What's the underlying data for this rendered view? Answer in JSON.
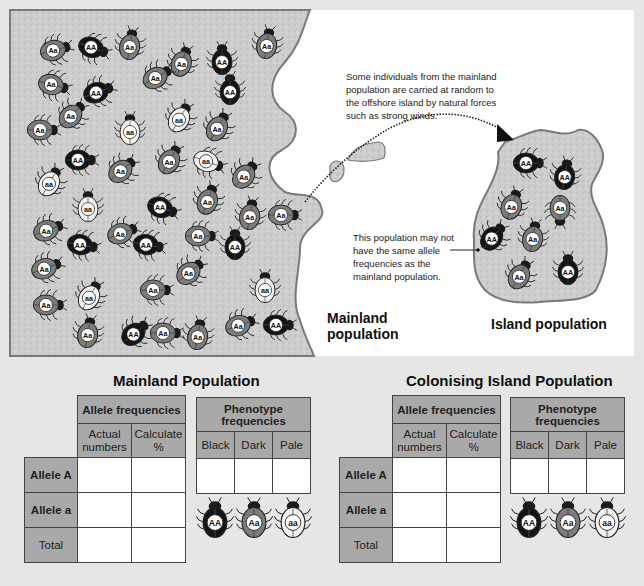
{
  "diagram": {
    "callout_top": "Some individuals from the mainland population are carried at random to the offshore island by natural forces such as strong winds.",
    "callout_top_lines": [
      "Some individuals from the mainland",
      "population are carried at random to",
      "the offshore island by natural forces",
      "such as strong winds."
    ],
    "callout_island_lines": [
      "This population may not",
      "have the same allele",
      "frequencies as the",
      "mainland population."
    ],
    "mainland_label_lines": [
      "Mainland",
      "population"
    ],
    "island_label": "Island population",
    "colors": {
      "background": "#e6e6e6",
      "land": "#c9c9c9",
      "coast": "#7a7a7a",
      "black_beetle": "#141414",
      "dark_beetle": "#7c7c7c",
      "pale_beetle": "#f2f2f2",
      "table_header": "#a9a9a9"
    },
    "mainland_beetles": [
      {
        "x": 55,
        "y": 50,
        "g": "Aa",
        "r": -15
      },
      {
        "x": 93,
        "y": 48,
        "g": "AA",
        "r": 20
      },
      {
        "x": 130,
        "y": 45,
        "g": "Aa",
        "r": -80
      },
      {
        "x": 182,
        "y": 62,
        "g": "Aa",
        "r": -70
      },
      {
        "x": 222,
        "y": 60,
        "g": "AA",
        "r": -90
      },
      {
        "x": 267,
        "y": 44,
        "g": "Aa",
        "r": -80
      },
      {
        "x": 53,
        "y": 85,
        "g": "Aa",
        "r": 15
      },
      {
        "x": 98,
        "y": 92,
        "g": "AA",
        "r": -20
      },
      {
        "x": 157,
        "y": 77,
        "g": "Aa",
        "r": -30
      },
      {
        "x": 230,
        "y": 90,
        "g": "AA",
        "r": -90
      },
      {
        "x": 72,
        "y": 115,
        "g": "Aa",
        "r": -45
      },
      {
        "x": 130,
        "y": 130,
        "g": "aa",
        "r": -90
      },
      {
        "x": 180,
        "y": 118,
        "g": "aa",
        "r": -60
      },
      {
        "x": 218,
        "y": 127,
        "g": "Aa",
        "r": -60
      },
      {
        "x": 42,
        "y": 130,
        "g": "Aa",
        "r": 0
      },
      {
        "x": 80,
        "y": 160,
        "g": "AA",
        "r": 0
      },
      {
        "x": 122,
        "y": 170,
        "g": "Aa",
        "r": -40
      },
      {
        "x": 170,
        "y": 160,
        "g": "Aa",
        "r": -60
      },
      {
        "x": 208,
        "y": 162,
        "g": "aa",
        "r": 20
      },
      {
        "x": 245,
        "y": 175,
        "g": "Aa",
        "r": -50
      },
      {
        "x": 50,
        "y": 182,
        "g": "aa",
        "r": -60
      },
      {
        "x": 88,
        "y": 207,
        "g": "aa",
        "r": -90
      },
      {
        "x": 162,
        "y": 208,
        "g": "AA",
        "r": 20
      },
      {
        "x": 208,
        "y": 200,
        "g": "Aa",
        "r": -70
      },
      {
        "x": 250,
        "y": 215,
        "g": "Aa",
        "r": -80
      },
      {
        "x": 283,
        "y": 215,
        "g": "Aa",
        "r": 0
      },
      {
        "x": 48,
        "y": 230,
        "g": "Aa",
        "r": -20
      },
      {
        "x": 82,
        "y": 245,
        "g": "AA",
        "r": 10
      },
      {
        "x": 122,
        "y": 233,
        "g": "Aa",
        "r": -20
      },
      {
        "x": 148,
        "y": 245,
        "g": "AA",
        "r": 10
      },
      {
        "x": 200,
        "y": 236,
        "g": "Aa",
        "r": 0
      },
      {
        "x": 235,
        "y": 245,
        "g": "AA",
        "r": -90
      },
      {
        "x": 46,
        "y": 268,
        "g": "Aa",
        "r": -20
      },
      {
        "x": 190,
        "y": 272,
        "g": "Aa",
        "r": -40
      },
      {
        "x": 155,
        "y": 290,
        "g": "Aa",
        "r": 0
      },
      {
        "x": 265,
        "y": 288,
        "g": "aa",
        "r": -90
      },
      {
        "x": 48,
        "y": 305,
        "g": "Aa",
        "r": 0
      },
      {
        "x": 90,
        "y": 296,
        "g": "aa",
        "r": -60
      },
      {
        "x": 88,
        "y": 333,
        "g": "Aa",
        "r": -80
      },
      {
        "x": 135,
        "y": 333,
        "g": "AA",
        "r": -40
      },
      {
        "x": 165,
        "y": 333,
        "g": "Aa",
        "r": 0
      },
      {
        "x": 198,
        "y": 335,
        "g": "Aa",
        "r": -80
      },
      {
        "x": 240,
        "y": 325,
        "g": "Aa",
        "r": -20
      },
      {
        "x": 278,
        "y": 325,
        "g": "AA",
        "r": 0
      }
    ],
    "island_beetles": [
      {
        "x": 528,
        "y": 163,
        "g": "AA",
        "r": 0
      },
      {
        "x": 565,
        "y": 175,
        "g": "AA",
        "r": -80
      },
      {
        "x": 512,
        "y": 205,
        "g": "Aa",
        "r": -70
      },
      {
        "x": 560,
        "y": 210,
        "g": "Aa",
        "r": 90
      },
      {
        "x": 493,
        "y": 237,
        "g": "AA",
        "r": -50
      },
      {
        "x": 533,
        "y": 237,
        "g": "Aa",
        "r": -80
      },
      {
        "x": 520,
        "y": 275,
        "g": "Aa",
        "r": -60
      },
      {
        "x": 568,
        "y": 270,
        "g": "AA",
        "r": -90
      }
    ]
  },
  "tables": [
    {
      "title": "Mainland Population",
      "allele_header": "Allele frequencies",
      "allele_subheaders": [
        "Actual numbers",
        "Calculate %"
      ],
      "allele_subheaders_lines": [
        [
          "Actual",
          "numbers"
        ],
        [
          "Calculate",
          "%"
        ]
      ],
      "rows": [
        {
          "label": "Allele A",
          "values": [
            "",
            ""
          ]
        },
        {
          "label": "Allele a",
          "values": [
            "",
            ""
          ]
        },
        {
          "label": "Total",
          "values": [
            "",
            ""
          ]
        }
      ],
      "phenotype_header_lines": [
        "Phenotype",
        "frequencies"
      ],
      "phenotype_columns": [
        "Black",
        "Dark",
        "Pale"
      ],
      "phenotype_values": [
        "",
        "",
        ""
      ],
      "legend_beetles": [
        {
          "g": "AA",
          "phenotype": "Black"
        },
        {
          "g": "Aa",
          "phenotype": "Dark"
        },
        {
          "g": "aa",
          "phenotype": "Pale"
        }
      ]
    },
    {
      "title": "Colonising Island Population",
      "allele_header": "Allele frequencies",
      "allele_subheaders": [
        "Actual numbers",
        "Calculate %"
      ],
      "allele_subheaders_lines": [
        [
          "Actual",
          "numbers"
        ],
        [
          "Calculate",
          "%"
        ]
      ],
      "rows": [
        {
          "label": "Allele A",
          "values": [
            "",
            ""
          ]
        },
        {
          "label": "Allele a",
          "values": [
            "",
            ""
          ]
        },
        {
          "label": "Total",
          "values": [
            "",
            ""
          ]
        }
      ],
      "phenotype_header_lines": [
        "Phenotype",
        "frequencies"
      ],
      "phenotype_columns": [
        "Black",
        "Dark",
        "Pale"
      ],
      "phenotype_values": [
        "",
        "",
        ""
      ],
      "legend_beetles": [
        {
          "g": "AA",
          "phenotype": "Black"
        },
        {
          "g": "Aa",
          "phenotype": "Dark"
        },
        {
          "g": "aa",
          "phenotype": "Pale"
        }
      ]
    }
  ]
}
